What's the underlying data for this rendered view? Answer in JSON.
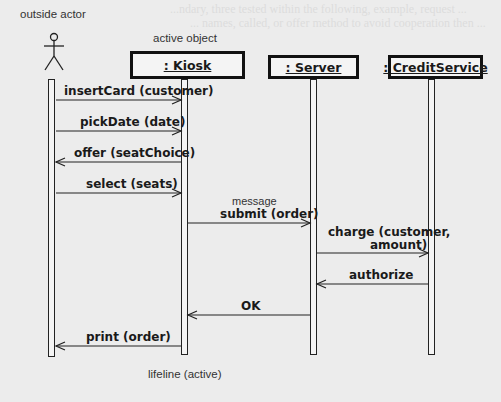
{
  "diagram": {
    "type": "UML sequence diagram",
    "bleed_text": [
      "...ndary, three tested within the following, example, request ...",
      "... names, called, or offer method to avoid cooperation then ..."
    ],
    "annotations": {
      "outside_actor": "outside actor",
      "active_object": "active object",
      "message": "message",
      "lifeline": "lifeline (active)"
    },
    "participants": [
      {
        "id": "actor",
        "label": "",
        "kind": "actor"
      },
      {
        "id": "kiosk",
        "label": ": Kiosk",
        "kind": "object"
      },
      {
        "id": "server",
        "label": ": Server",
        "kind": "object"
      },
      {
        "id": "credit",
        "label": ": CreditService",
        "kind": "object"
      }
    ],
    "messages": [
      {
        "from": "actor",
        "to": "kiosk",
        "label": "insertCard (customer)"
      },
      {
        "from": "actor",
        "to": "kiosk",
        "label": "pickDate (date)"
      },
      {
        "from": "kiosk",
        "to": "actor",
        "label": "offer (seatChoice)"
      },
      {
        "from": "actor",
        "to": "kiosk",
        "label": "select (seats)"
      },
      {
        "from": "kiosk",
        "to": "server",
        "label": "submit (order)"
      },
      {
        "from": "server",
        "to": "credit",
        "label": "charge (customer,",
        "label2": "amount)"
      },
      {
        "from": "credit",
        "to": "server",
        "label": "authorize"
      },
      {
        "from": "server",
        "to": "kiosk",
        "label": "OK"
      },
      {
        "from": "kiosk",
        "to": "actor",
        "label": "print (order)"
      }
    ]
  }
}
